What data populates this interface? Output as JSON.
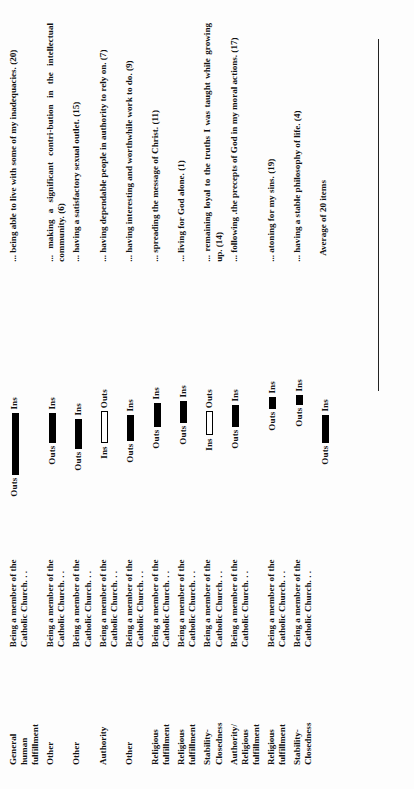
{
  "figure": {
    "footer_label": "Average of 20 items",
    "group_labels": {
      "outs": "Outs",
      "ins": "Ins"
    },
    "colors": {
      "bar_fill": "#000000",
      "bar_hollow": "#ffffff",
      "rule": "#222222",
      "page": "#fdfdfd"
    }
  },
  "chart_data": {
    "type": "bar",
    "title": "",
    "xlabel": "",
    "ylabel": "",
    "legend": [
      "Outs",
      "Ins"
    ],
    "legend_position": "inline-per-row",
    "grid": false,
    "note": "Each row shows a horizontal segment whose endpoints are labelled Outs and Ins; segment length = difference between the two groups. One row (Stability-Closedness / living for God alone) is drawn hollow and has the Ins label on the left, i.e. reversed direction.",
    "categories": [
      "General human fulfillment",
      "Other",
      "Other",
      "Authority",
      "Other",
      "Religious fulfillment",
      "Religious fulfillment",
      "Stability-Closedness",
      "Authority/Religious fulfillment",
      "Religious fulfillment",
      "Stability-Closedness"
    ],
    "items": [
      "... being able to live with some of my inadequacies.  (20)",
      "... making a significant contribution in the intellectual community.  (6)",
      "... having a satisfactory sexual outlet.  (15)",
      "... having dependable people in authority to rely on.  (7)",
      "... having interesting and worthwhile work to do.  (9)",
      "... spreading the message of Christ.  (11)",
      "... living for God alone.  (1)",
      "... remaining loyal to the truths I was taught while growing up.  (14)",
      "... following .the precepts of God in my moral actions. (17)",
      "... atoning for my sins.  (19)",
      "... having a stable philosophy of life.  (4)"
    ],
    "item_numbers": [
      20,
      6,
      15,
      7,
      9,
      11,
      1,
      14,
      17,
      19,
      4
    ],
    "left_labels": [
      "Outs",
      "Outs",
      "Outs",
      "Outs",
      "Outs",
      "Outs",
      "Outs",
      "Ins",
      "Outs",
      "Outs",
      "Outs",
      "Outs"
    ],
    "right_labels": [
      "Ins",
      "Ins",
      "Ins",
      "Ins",
      "Ins",
      "Ins",
      "Ins",
      "Outs",
      "Ins",
      "Ins",
      "Ins",
      "Ins"
    ],
    "bar_lengths_px": [
      62,
      30,
      30,
      38,
      30,
      25,
      22,
      24,
      20,
      12,
      10,
      28
    ],
    "bar_offsets_px": [
      4,
      36,
      36,
      27,
      40,
      47,
      54,
      47,
      58,
      70,
      74,
      36
    ],
    "bar_filled": [
      true,
      true,
      true,
      true,
      true,
      true,
      true,
      false,
      true,
      true,
      true,
      true
    ]
  },
  "rows": [
    {
      "category": [
        "General",
        "human",
        "fulfillment"
      ],
      "stem": [
        "Being a member of the",
        "Catholic Church. . ."
      ],
      "item": "... being able to live with some of my inadequacies.  (20)",
      "left": "Outs",
      "right": "Ins",
      "bar_len": 62,
      "bar_off": 4,
      "filled": true
    },
    {
      "category": [
        "Other"
      ],
      "stem": [
        "Being a member of the",
        "Catholic Church. . ."
      ],
      "item": "... making a significant contri-bution in the intellectual community.  (6)",
      "left": "Outs",
      "right": "Ins",
      "bar_len": 30,
      "bar_off": 36,
      "filled": true
    },
    {
      "category": [
        "Other"
      ],
      "stem": [
        "Being a member of the",
        "Catholic Church. . ."
      ],
      "item": "... having a satisfactory sexual outlet.  (15)",
      "left": "Outs",
      "right": "Ins",
      "bar_len": 30,
      "bar_off": 30,
      "filled": true
    },
    {
      "category": [
        "Authority"
      ],
      "stem": [
        "Being a member of the",
        "Catholic Church. . ."
      ],
      "item": "... having dependable people in authority to rely on.  (7)",
      "left": "Ins",
      "right": "Outs",
      "bar_len": 32,
      "bar_off": 42,
      "filled": false
    },
    {
      "category": [
        "Other"
      ],
      "stem": [
        "Being a member of the",
        "Catholic Church. . ."
      ],
      "item": "... having interesting and worthwhile work to do.  (9)",
      "left": "Outs",
      "right": "Ins",
      "bar_len": 26,
      "bar_off": 38,
      "filled": true
    },
    {
      "category": [
        "Religious",
        "fulfillment"
      ],
      "stem": [
        "Being a member of the",
        "Catholic Church. . ."
      ],
      "item": "... spreading the message of Christ.  (11)",
      "left": "Outs",
      "right": "Ins",
      "bar_len": 24,
      "bar_off": 52,
      "filled": true
    },
    {
      "category": [
        "Religious",
        "fulfillment"
      ],
      "stem": [
        "Being a member of the",
        "Catholic Church. . ."
      ],
      "item": "... living for God alone.  (1)",
      "left": "Outs",
      "right": "Ins",
      "bar_len": 22,
      "bar_off": 56,
      "filled": true
    },
    {
      "category": [
        "Stability-",
        "Closedness"
      ],
      "stem": [
        "Being a member of the",
        "Catholic Church. . ."
      ],
      "item": "... remaining loyal to the truths I was taught while growing up.  (14)",
      "left": "Ins",
      "right": "Outs",
      "bar_len": 24,
      "bar_off": 50,
      "filled": false
    },
    {
      "category": [
        "Authority/",
        "Religious",
        "fulfillment"
      ],
      "stem": [
        "Being a member of the",
        "Catholic Church. . ."
      ],
      "item": "... following .the precepts of God in my moral actions. (17)",
      "left": "Outs",
      "right": "Ins",
      "bar_len": 22,
      "bar_off": 52,
      "filled": true
    },
    {
      "category": [
        "Religious",
        "fulfillment"
      ],
      "stem": [
        "Being a member of the",
        "Catholic Church. . ."
      ],
      "item": "... atoning for my sins.  (19)",
      "left": "Outs",
      "right": "Ins",
      "bar_len": 12,
      "bar_off": 70,
      "filled": true
    },
    {
      "category": [
        "Stability-",
        "Closedness"
      ],
      "stem": [
        "Being a member of the",
        "Catholic Church. . ."
      ],
      "item": "... having a stable philosophy of life.  (4)",
      "left": "Outs",
      "right": "Ins",
      "bar_len": 10,
      "bar_off": 74,
      "filled": true
    }
  ],
  "average_row": {
    "left": "Outs",
    "right": "Ins",
    "bar_len": 28,
    "bar_off": 36,
    "filled": true,
    "label": "Average of 20 items"
  }
}
